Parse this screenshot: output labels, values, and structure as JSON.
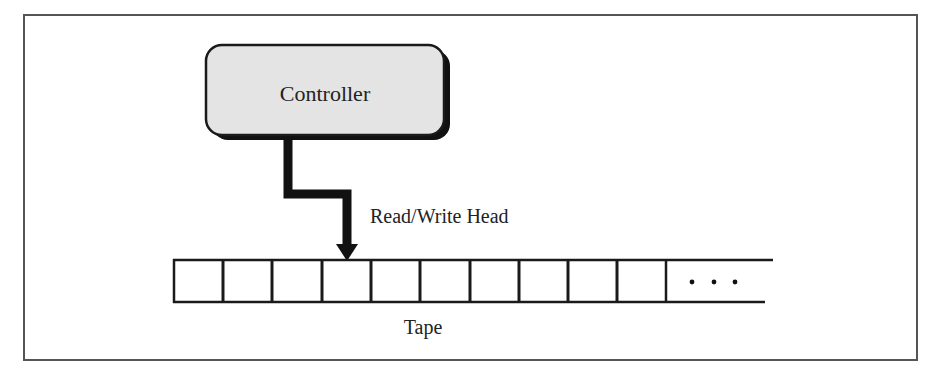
{
  "diagram": {
    "controller": {
      "label": "Controller",
      "fill": "#e4e4e4",
      "stroke": "#1a1a1a"
    },
    "head": {
      "label": "Read/Write Head"
    },
    "tape": {
      "label": "Tape",
      "cell_count": 10,
      "ellipsis": "· · ·"
    },
    "colors": {
      "line": "#1a1a1a",
      "frame": "#555555",
      "text": "#222222"
    }
  }
}
